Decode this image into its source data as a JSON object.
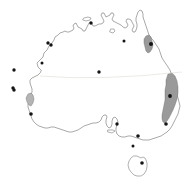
{
  "figure": {
    "type": "distribution-map",
    "region": "Australia",
    "background_color": "#ffffff",
    "width": 191,
    "height": 185
  },
  "style": {
    "coastline_color": "#6f6f6f",
    "coastline_fill": "#ffffff",
    "range_fill_color": "#9a9a9a",
    "range_fill_color_light": "#b4b4b4",
    "range_stroke_color": "#6b6b6b",
    "point_color": "#141414",
    "graticule_color": "#d8d8d0"
  },
  "chart_data": {
    "type": "scatter",
    "title": "",
    "xlabel": "",
    "ylabel": "",
    "grid": false,
    "legend": "none",
    "xlim": [
      0,
      191
    ],
    "ylim": [
      0,
      185
    ],
    "graticules": [
      {
        "name": "tropic-of-capricorn",
        "path": "M 40 76 Q 100 81 182 72",
        "color": "#d8d8d0"
      }
    ],
    "landmasses": [
      {
        "name": "australia-mainland",
        "path": "M 41 70 L 38 67 L 37 63 L 40 60 L 43 57 L 44 53 L 47 50 L 49 46 L 52 43 L 54 40 L 55 37 L 58 35 L 60 33 L 63 32 L 65 31 L 67 32 L 69 32 L 71 31 L 73 30 L 74 28 L 73 26 L 74 24 L 76 23 L 77 25 L 78 27 L 80 28 L 82 29 L 83 31 L 85 31 L 86 29 L 87 27 L 88 25 L 89 23 L 91 22 L 92 24 L 93 26 L 95 26 L 97 25 L 99 24 L 101 24 L 103 23 L 104 21 L 103 19 L 102 17 L 101 15 L 102 13 L 104 13 L 105 15 L 106 17 L 108 16 L 110 15 L 111 13 L 113 13 L 114 15 L 113 17 L 112 19 L 113 21 L 115 22 L 117 23 L 119 24 L 121 25 L 123 27 L 125 28 L 127 27 L 128 25 L 127 23 L 126 21 L 127 19 L 129 19 L 131 20 L 132 22 L 133 24 L 134 26 L 133 28 L 132 30 L 133 32 L 135 32 L 136 30 L 137 27 L 137 24 L 136 21 L 136 18 L 137 15 L 138 12 L 140 10 L 142 11 L 143 14 L 143 17 L 144 20 L 145 23 L 146 26 L 147 29 L 148 32 L 149 35 L 151 38 L 153 40 L 155 43 L 157 46 L 159 49 L 160 52 L 161 55 L 162 58 L 164 61 L 166 64 L 168 67 L 170 70 L 171 73 L 172 76 L 173 79 L 174 82 L 175 86 L 176 90 L 177 94 L 178 98 L 179 102 L 180 106 L 179 110 L 178 114 L 176 118 L 174 122 L 172 126 L 170 129 L 167 132 L 164 134 L 161 136 L 158 137 L 155 138 L 152 139 L 149 140 L 146 140 L 143 140 L 140 139 L 137 138 L 134 137 L 131 136 L 128 136 L 125 137 L 122 137 L 119 136 L 117 134 L 116 131 L 116 128 L 117 125 L 118 122 L 117 119 L 115 117 L 113 118 L 112 121 L 112 124 L 111 127 L 109 128 L 107 126 L 106 123 L 106 120 L 107 117 L 106 115 L 104 115 L 102 117 L 101 120 L 99 122 L 96 123 L 93 123 L 90 124 L 87 125 L 84 126 L 81 128 L 78 130 L 75 131 L 72 132 L 69 132 L 66 131 L 63 130 L 60 129 L 57 128 L 54 127 L 51 127 L 48 128 L 45 128 L 42 127 L 39 126 L 36 124 L 34 122 L 32 119 L 31 116 L 30 113 L 29 110 L 28 107 L 28 104 L 29 101 L 30 98 L 31 95 L 32 92 L 32 89 L 31 86 L 30 83 L 30 80 L 32 78 L 34 77 L 36 76 L 38 75 L 40 73 Z"
      },
      {
        "name": "tasmania",
        "path": "M 131 158 L 129 161 L 128 165 L 129 169 L 131 172 L 134 175 L 137 176 L 141 176 L 144 174 L 146 171 L 147 167 L 147 163 L 146 160 L 145 158 L 143 157 L 141 158 L 139 157 L 137 156 L 134 156 Z"
      },
      {
        "name": "melville-island",
        "path": "M 84 18 L 88 17 L 91 18 L 90 20 L 86 21 L 83 20 Z"
      },
      {
        "name": "kangaroo-island",
        "path": "M 108 130 L 113 130 L 115 131 L 112 133 L 108 132 Z"
      },
      {
        "name": "groote-eylandt",
        "path": "M 111 29 L 114 29 L 115 31 L 113 33 L 110 32 Z"
      },
      {
        "name": "fraser-island",
        "path": "M 173 85 L 176 86 L 177 90 L 176 93 L 174 92 L 172 89 Z"
      }
    ],
    "range_polygons": [
      {
        "name": "range-cairns-wet-tropics",
        "region": "northeast-queensland-coast",
        "fill": "#9a9a9a",
        "path": "M 146 36 L 149 35 L 151 37 L 152 41 L 153 45 L 152 49 L 150 52 L 148 53 L 146 51 L 145 47 L 144 43 L 144 39 Z"
      },
      {
        "name": "range-great-dividing-southeast",
        "region": "southeast-coast-great-dividing-range",
        "fill": "#9a9a9a",
        "path": "M 168 74 L 172 73 L 175 76 L 177 81 L 178 87 L 178 93 L 177 99 L 175 105 L 173 110 L 171 114 L 169 118 L 167 121 L 165 123 L 163 122 L 162 119 L 162 115 L 163 110 L 164 105 L 165 100 L 165 95 L 165 90 L 166 85 L 166 80 Z"
      },
      {
        "name": "range-southwest-western-australia",
        "region": "southwest-western-australia",
        "fill": "#b4b4b4",
        "path": "M 28 94 L 31 93 L 33 95 L 34 99 L 33 103 L 31 106 L 29 105 L 27 102 L 26 98 Z"
      }
    ],
    "occurrence_points": [
      {
        "name": "point-darwin",
        "x": 91,
        "y": 23,
        "r": 1.7
      },
      {
        "name": "point-broome-north",
        "x": 48,
        "y": 43,
        "r": 1.7
      },
      {
        "name": "point-broome-south",
        "x": 51,
        "y": 45,
        "r": 1.7
      },
      {
        "name": "point-kimberley-inland",
        "x": 42,
        "y": 63,
        "r": 1.5
      },
      {
        "name": "point-pilbara-coast",
        "x": 14,
        "y": 70,
        "r": 1.7
      },
      {
        "name": "point-shark-bay",
        "x": 13,
        "y": 88,
        "r": 1.7
      },
      {
        "name": "point-perth",
        "x": 14,
        "y": 90,
        "r": 1.7
      },
      {
        "name": "point-southwest-cape",
        "x": 31,
        "y": 114,
        "r": 1.8
      },
      {
        "name": "point-alice-springs",
        "x": 99,
        "y": 72,
        "r": 1.7
      },
      {
        "name": "point-cairns",
        "x": 151,
        "y": 44,
        "r": 2.0
      },
      {
        "name": "point-cape-york-inland",
        "x": 124,
        "y": 41,
        "r": 1.5
      },
      {
        "name": "point-sydney",
        "x": 170,
        "y": 96,
        "r": 1.9
      },
      {
        "name": "point-southcoast-nsw",
        "x": 166,
        "y": 124,
        "r": 1.8
      },
      {
        "name": "point-spencer-gulf",
        "x": 117,
        "y": 124,
        "r": 1.7
      },
      {
        "name": "point-melbourne",
        "x": 138,
        "y": 136,
        "r": 1.8
      },
      {
        "name": "point-victoria-inland",
        "x": 133,
        "y": 146,
        "r": 1.5
      },
      {
        "name": "point-hobart",
        "x": 142,
        "y": 163,
        "r": 1.8
      }
    ]
  }
}
